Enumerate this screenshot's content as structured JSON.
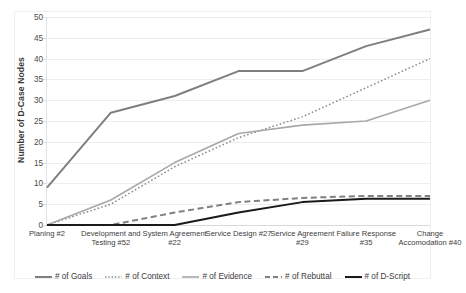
{
  "chart_data": {
    "type": "line",
    "title": "",
    "xlabel": "",
    "ylabel": "Number of D-Case Nodes",
    "ylim": [
      0,
      50
    ],
    "ytick_step": 5,
    "yticks": [
      50,
      45,
      40,
      35,
      30,
      25,
      20,
      15,
      10,
      5,
      0
    ],
    "grid": "horizontal",
    "legend_position": "bottom",
    "categories": [
      "Planing #2",
      "Development and Testing #52",
      "System Agreement #22",
      "Service Design #27",
      "Service Agreement #29",
      "Failure Response #35",
      "Change Accomodation #40"
    ],
    "series": [
      {
        "name": "# of Goals",
        "values": [
          9,
          27,
          31,
          37,
          37,
          43,
          47
        ],
        "color": "#7f7f7f",
        "style": "solid",
        "width": 2.0
      },
      {
        "name": "# of Context",
        "values": [
          0,
          5,
          14,
          21,
          26,
          33,
          40
        ],
        "color": "#8c8c8c",
        "style": "dotted",
        "width": 1.5
      },
      {
        "name": "# of Evidence",
        "values": [
          0,
          6,
          15,
          22,
          24,
          25,
          30
        ],
        "color": "#a8a8a8",
        "style": "solid",
        "width": 1.6
      },
      {
        "name": "# of Rebuttal",
        "values": [
          0,
          0,
          3,
          5.5,
          6.5,
          7,
          7
        ],
        "color": "#808080",
        "style": "dashed",
        "width": 2.0
      },
      {
        "name": "# of D-Script",
        "values": [
          0,
          0,
          0,
          3,
          5.5,
          6.3,
          6.3
        ],
        "color": "#1a1a1a",
        "style": "solid",
        "width": 2.0
      }
    ]
  }
}
